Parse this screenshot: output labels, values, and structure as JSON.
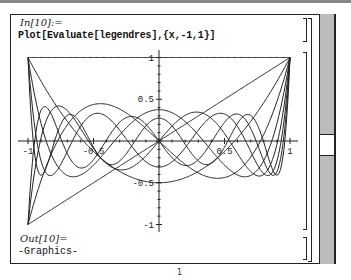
{
  "notebook": {
    "input_label": "In[10]:=",
    "input_code": "Plot[Evaluate[legendres],{x,-1,1}]",
    "output_label": "Out[10]=",
    "output_text": "-Graphics-",
    "page_number": "1"
  },
  "scrollbar": {
    "thumb_position_pct": 48
  },
  "chart_data": {
    "type": "line",
    "title": "",
    "xlabel": "x",
    "ylabel": "",
    "xlim": [
      -1,
      1
    ],
    "ylim": [
      -1,
      1
    ],
    "x_ticks": [
      "-1",
      "-0.5",
      "0.5",
      "1"
    ],
    "y_ticks": [
      "-1",
      "-0.5",
      "0.5",
      "1"
    ],
    "grid": false,
    "legend": "none",
    "series": [
      {
        "name": "P0(x)",
        "formula": "1"
      },
      {
        "name": "P1(x)",
        "formula": "x"
      },
      {
        "name": "P2(x)",
        "formula": "(3x^2-1)/2"
      },
      {
        "name": "P3(x)",
        "formula": "(5x^3-3x)/2"
      },
      {
        "name": "P4(x)",
        "formula": "(35x^4-30x^2+3)/8"
      },
      {
        "name": "P5(x)",
        "formula": "(63x^5-70x^3+15x)/8"
      },
      {
        "name": "P6(x)",
        "formula": "(231x^6-315x^4+105x^2-5)/16"
      },
      {
        "name": "P7(x)",
        "formula": "(429x^7-693x^5+315x^3-35x)/16"
      },
      {
        "name": "P8(x)",
        "formula": "(6435x^8-12012x^6+6930x^4-1260x^2+35)/128"
      }
    ]
  }
}
